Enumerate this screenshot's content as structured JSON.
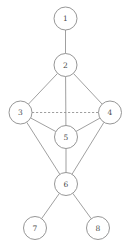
{
  "diagram": {
    "type": "graph",
    "width": 129,
    "height": 246,
    "background_color": "#ffffff",
    "node_fill_color": "#ffffff",
    "node_stroke_color": "#8a8a8a",
    "node_label_color": "#4a4a4a",
    "edge_color": "#8f8f8f",
    "node_radius": 11.5,
    "nodes": [
      {
        "id": "1",
        "label": "1",
        "cx": 65.5,
        "cy": 18.5
      },
      {
        "id": "2",
        "label": "2",
        "cx": 65.5,
        "cy": 65.0
      },
      {
        "id": "3",
        "label": "3",
        "cx": 20.5,
        "cy": 112.5
      },
      {
        "id": "4",
        "label": "4",
        "cx": 110.0,
        "cy": 112.5
      },
      {
        "id": "5",
        "label": "5",
        "cx": 66.0,
        "cy": 137.0
      },
      {
        "id": "6",
        "label": "6",
        "cx": 66.0,
        "cy": 184.0
      },
      {
        "id": "7",
        "label": "7",
        "cx": 35.0,
        "cy": 228.0
      },
      {
        "id": "8",
        "label": "8",
        "cx": 98.0,
        "cy": 228.0
      }
    ],
    "edges": [
      {
        "from": "1",
        "to": "2",
        "style": "solid"
      },
      {
        "from": "2",
        "to": "3",
        "style": "solid"
      },
      {
        "from": "2",
        "to": "4",
        "style": "solid"
      },
      {
        "from": "2",
        "to": "5",
        "style": "solid"
      },
      {
        "from": "3",
        "to": "4",
        "style": "dashed"
      },
      {
        "from": "3",
        "to": "5",
        "style": "solid"
      },
      {
        "from": "4",
        "to": "5",
        "style": "solid"
      },
      {
        "from": "3",
        "to": "6",
        "style": "solid"
      },
      {
        "from": "4",
        "to": "6",
        "style": "solid"
      },
      {
        "from": "5",
        "to": "6",
        "style": "solid"
      },
      {
        "from": "6",
        "to": "7",
        "style": "solid"
      },
      {
        "from": "6",
        "to": "8",
        "style": "solid"
      }
    ]
  }
}
